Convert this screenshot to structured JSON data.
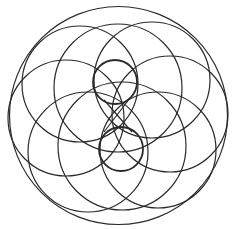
{
  "figure": {
    "width": 237,
    "height": 229,
    "stroke_color": "#2a2a2a",
    "background": "#ffffff",
    "outer_circle": {
      "cx": 118.5,
      "cy": 115.5,
      "r": 109,
      "stroke_width": 1.2
    },
    "inner_circles": [
      {
        "name": "top-small-circle",
        "cx": 115,
        "cy": 82,
        "r": 22,
        "stroke_width": 1.8
      },
      {
        "name": "bottom-small-circle",
        "cx": 121,
        "cy": 149,
        "r": 22,
        "stroke_width": 1.8
      }
    ],
    "petal_circles": [
      {
        "name": "upper-left-circle",
        "cx": 80,
        "cy": 84,
        "r": 58
      },
      {
        "name": "upper-right-circle",
        "cx": 152,
        "cy": 80,
        "r": 58
      },
      {
        "name": "top-wide-circle",
        "cx": 118,
        "cy": 88,
        "r": 64
      },
      {
        "name": "right-circle",
        "cx": 170,
        "cy": 114,
        "r": 58
      },
      {
        "name": "lower-right-circle",
        "cx": 158,
        "cy": 150,
        "r": 58
      },
      {
        "name": "bottom-wide-circle",
        "cx": 122,
        "cy": 146,
        "r": 64
      },
      {
        "name": "lower-left-circle",
        "cx": 88,
        "cy": 152,
        "r": 60
      },
      {
        "name": "left-circle",
        "cx": 66,
        "cy": 118,
        "r": 58
      }
    ],
    "cross_lines": [
      {
        "name": "cross-line-a",
        "x1": 104,
        "y1": 100,
        "x2": 132,
        "y2": 132
      },
      {
        "name": "cross-line-b",
        "x1": 130,
        "y1": 98,
        "x2": 104,
        "y2": 132
      }
    ],
    "petal_stroke_width": 1.2
  }
}
